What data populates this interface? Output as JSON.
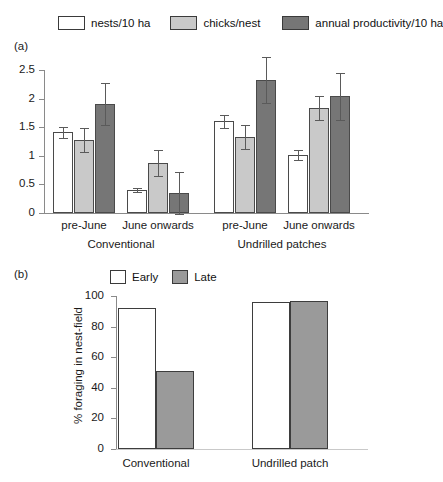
{
  "figure": {
    "panel_a_tag": "(a)",
    "panel_b_tag": "(b)"
  },
  "legend_top": {
    "items": [
      {
        "label": "nests/10 ha",
        "swatch": "white",
        "color": "#ffffff"
      },
      {
        "label": "chicks/nest",
        "swatch": "light-gray",
        "color": "#c9c9c9"
      },
      {
        "label": "annual productivity/10 ha",
        "swatch": "dark-gray",
        "color": "#767676"
      }
    ]
  },
  "legend_b": {
    "items": [
      {
        "label": "Early",
        "swatch": "white",
        "color": "#ffffff"
      },
      {
        "label": "Late",
        "swatch": "gray",
        "color": "#9a9a9a"
      }
    ]
  },
  "chart_data": [
    {
      "type": "bar",
      "panel": "(a)",
      "title": "",
      "xlabel": "",
      "ylabel": "",
      "ylim": [
        0,
        2.5
      ],
      "yticks": [
        0,
        0.5,
        1,
        1.5,
        2,
        2.5
      ],
      "ytick_labels": [
        "0",
        "0.5",
        "1",
        "1.5",
        "2",
        "2.5"
      ],
      "grid": false,
      "legend_position": "top",
      "categories": [
        "pre-June",
        "June onwards",
        "pre-June",
        "June onwards"
      ],
      "group_labels": [
        "Conventional",
        "Undrilled patches"
      ],
      "series": [
        {
          "name": "nests/10 ha",
          "color": "#ffffff",
          "values": [
            1.41,
            0.4,
            1.6,
            1.01
          ],
          "errors": [
            0.1,
            0.04,
            0.12,
            0.09
          ]
        },
        {
          "name": "chicks/nest",
          "color": "#c9c9c9",
          "values": [
            1.28,
            0.87,
            1.33,
            1.83
          ],
          "errors": [
            0.21,
            0.23,
            0.21,
            0.21
          ]
        },
        {
          "name": "annual productivity/10 ha",
          "color": "#767676",
          "values": [
            1.91,
            0.35,
            2.33,
            2.04
          ],
          "errors": [
            0.37,
            0.37,
            0.4,
            0.41
          ]
        }
      ]
    },
    {
      "type": "bar",
      "panel": "(b)",
      "title": "",
      "xlabel": "",
      "ylabel": "% foraging in nest-field",
      "ylim": [
        0,
        100
      ],
      "yticks": [
        0,
        20,
        40,
        60,
        80,
        100
      ],
      "ytick_labels": [
        "0",
        "20",
        "40",
        "60",
        "80",
        "100"
      ],
      "grid": false,
      "legend_position": "top",
      "categories": [
        "Conventional",
        "Undrilled patch"
      ],
      "series": [
        {
          "name": "Early",
          "color": "#ffffff",
          "values": [
            92,
            96
          ]
        },
        {
          "name": "Late",
          "color": "#9a9a9a",
          "values": [
            51,
            97
          ]
        }
      ]
    }
  ]
}
